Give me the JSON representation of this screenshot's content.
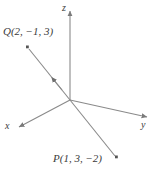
{
  "figure": {
    "background_color": "#ffffff",
    "line_color": "#808080",
    "text_color": "#3b3b3b"
  },
  "axes": {
    "z": {
      "label": "z",
      "arrow": "up"
    },
    "x": {
      "label": "x",
      "arrow": "down-left"
    },
    "y": {
      "label": "y",
      "arrow": "right"
    },
    "origin": {
      "x": 70,
      "y": 100
    }
  },
  "points": {
    "q": {
      "name": "Q",
      "label": "Q(2, −1, 3)",
      "coordinates": [
        2,
        -1,
        3
      ],
      "marker": {
        "x": 27,
        "y": 47
      }
    },
    "p": {
      "name": "P",
      "label": "P(1, 3, −2)",
      "coordinates": [
        1,
        3,
        -2
      ],
      "marker": {
        "x": 116,
        "y": 157
      }
    }
  },
  "segment": {
    "from": "P",
    "to": "Q",
    "direction_arrow": "toward-Q",
    "passes_through_origin": true
  }
}
